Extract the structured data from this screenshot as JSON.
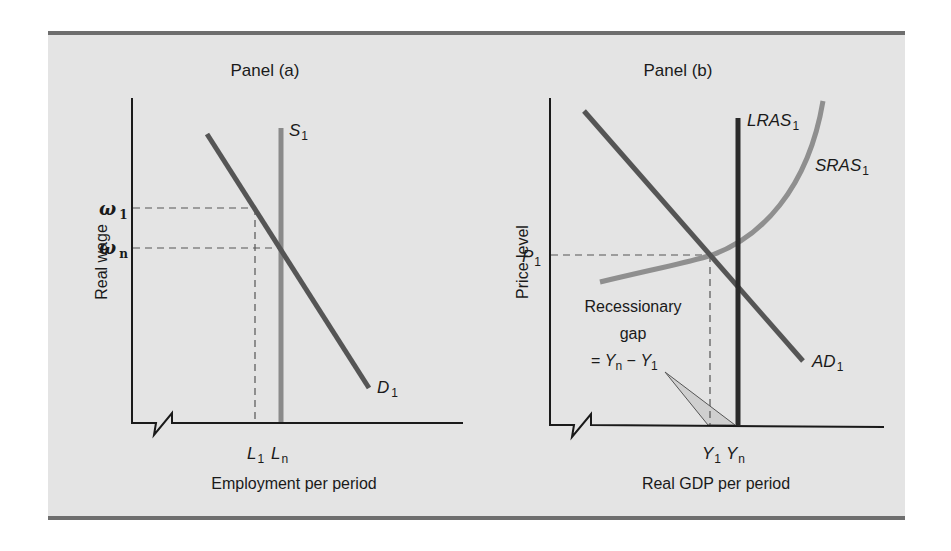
{
  "panels": {
    "a": {
      "title": "Panel (a)",
      "y_axis_label": "Real wage",
      "x_axis_label": "Employment per period",
      "y_ticks": [
        {
          "symbol": "ω",
          "sub": "1"
        },
        {
          "symbol": "ω",
          "sub": "n"
        }
      ],
      "x_ticks": [
        {
          "symbol": "L",
          "sub": "1"
        },
        {
          "symbol": "L",
          "sub": "n"
        }
      ],
      "curves": {
        "supply": {
          "name": "S",
          "sub": "1"
        },
        "demand": {
          "name": "D",
          "sub": "1"
        }
      }
    },
    "b": {
      "title": "Panel (b)",
      "y_axis_label": "Price level",
      "x_axis_label": "Real GDP per period",
      "y_ticks": [
        {
          "symbol": "P",
          "sub": "1"
        }
      ],
      "x_ticks": [
        {
          "symbol": "Y",
          "sub": "1"
        },
        {
          "symbol": "Y",
          "sub": "n"
        }
      ],
      "curves": {
        "lras": {
          "name": "LRAS",
          "sub": "1"
        },
        "sras": {
          "name": "SRAS",
          "sub": "1"
        },
        "ad": {
          "name": "AD",
          "sub": "1"
        }
      },
      "annotation": {
        "line1": "Recessionary",
        "line2": "gap",
        "eq_prefix": "= ",
        "eq_a": "Y",
        "eq_a_sub": "n",
        "eq_minus": " − ",
        "eq_b": "Y",
        "eq_b_sub": "1"
      }
    }
  },
  "colors": {
    "background": "#e4e4e4",
    "frame_rule": "#6e6e6e",
    "axis": "#1a1a1a",
    "demand_curve": "#555555",
    "supply_curve": "#8a8a8a",
    "lras_curve": "#2a2a2a",
    "sras_curve": "#8f8f8f",
    "dashed": "#555555",
    "gap_fill": "#cfcfcf"
  }
}
